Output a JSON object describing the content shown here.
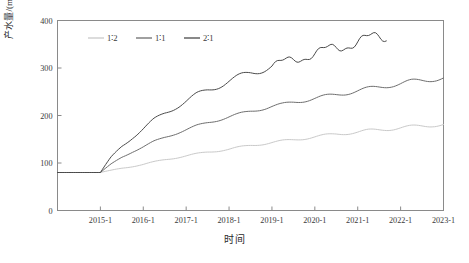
{
  "chart_data": {
    "type": "line",
    "title": "",
    "subtitle": "",
    "xlabel": "时间",
    "ylabel": "产水量/(m³/m³)",
    "ylabel_plain": "产水量/(m3/m3)",
    "ylim": [
      0,
      400
    ],
    "yticks": [
      0,
      100,
      200,
      300,
      400
    ],
    "ytick_labels": [
      "0",
      "100",
      "200",
      "300",
      "400"
    ],
    "xlim": [
      "2014-1",
      "2023-1"
    ],
    "xticks": [
      "2015-1",
      "2016-1",
      "2017-1",
      "2018-1",
      "2019-1",
      "2020-1",
      "2021-1",
      "2022-1",
      "2023-1"
    ],
    "xtick_labels": [
      "2015-1",
      "2016-1",
      "2017-1",
      "2018-1",
      "2019-1",
      "2020-1",
      "2021-1",
      "2022-1",
      "2023-1"
    ],
    "grid": false,
    "legend_position": "top-left-inside",
    "legend_entries": [
      "1∶2",
      "1∶1",
      "2∶1"
    ],
    "x_months": [
      "2014-1",
      "2014-4",
      "2014-7",
      "2014-10",
      "2015-1",
      "2015-4",
      "2015-7",
      "2015-10",
      "2016-1",
      "2016-4",
      "2016-7",
      "2016-10",
      "2017-1",
      "2017-4",
      "2017-7",
      "2017-10",
      "2018-1",
      "2018-4",
      "2018-7",
      "2018-10",
      "2019-1",
      "2019-4",
      "2019-7",
      "2019-10",
      "2020-1",
      "2020-4",
      "2020-7",
      "2020-10",
      "2021-1",
      "2021-4",
      "2021-7",
      "2021-10",
      "2022-1",
      "2022-4",
      "2022-7",
      "2022-10",
      "2023-1"
    ],
    "series": [
      {
        "name": "1∶2",
        "color": "#c9c9c9",
        "width": 1.0,
        "start_value": 80,
        "end_value": 181,
        "end_x": "2023-1",
        "values": [
          80,
          80,
          80,
          80,
          80,
          84,
          89,
          93,
          97,
          102,
          107,
          111,
          115,
          119,
          123,
          126,
          129,
          133,
          137,
          140,
          143,
          146,
          149,
          152,
          155,
          158,
          161,
          163,
          165,
          168,
          170,
          172,
          174,
          176,
          178,
          180,
          181
        ]
      },
      {
        "name": "1∶1",
        "color": "#6d6d6d",
        "width": 1.0,
        "start_value": 80,
        "end_value": 279,
        "end_x": "2023-1",
        "values": [
          80,
          80,
          80,
          80,
          80,
          97,
          112,
          124,
          134,
          145,
          154,
          162,
          170,
          178,
          185,
          191,
          197,
          203,
          209,
          214,
          219,
          223,
          228,
          232,
          236,
          240,
          244,
          248,
          252,
          256,
          260,
          264,
          267,
          271,
          274,
          277,
          279
        ]
      },
      {
        "name": "2∶1",
        "color": "#4a4a4a",
        "width": 1.0,
        "start_value": 80,
        "end_value": 368,
        "end_x": "2021-9",
        "values": [
          80,
          80,
          80,
          80,
          80,
          110,
          135,
          155,
          172,
          190,
          205,
          218,
          230,
          243,
          254,
          263,
          272,
          281,
          290,
          297,
          304,
          311,
          318,
          324,
          330,
          337,
          343,
          349,
          355,
          361,
          366,
          368
        ]
      }
    ],
    "seasonal_oscillation": {
      "present": true,
      "period": "1 year",
      "note": "amplitude grows with time; largest on the 2∶1 series"
    }
  },
  "axes": {
    "x_axis_name": "时间",
    "y_axis_name": "产水量/(m³/m³)"
  },
  "legend": {
    "items": [
      {
        "label": "1∶2",
        "color": "#c9c9c9"
      },
      {
        "label": "1∶1",
        "color": "#6d6d6d"
      },
      {
        "label": "2∶1",
        "color": "#4a4a4a"
      }
    ]
  },
  "style": {
    "background": "#ffffff",
    "frame_color": "#808080",
    "text_color": "#3a3a3a"
  }
}
